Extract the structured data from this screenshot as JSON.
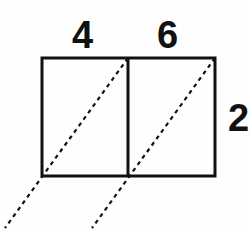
{
  "figure": {
    "kind": "geometry-diagram",
    "background_color": "#fefefe",
    "stroke_color": "#111111",
    "solid_stroke_width": 3,
    "dashed_stroke_width": 2.2,
    "dash_pattern": "4 4",
    "labels": {
      "top_left": "4",
      "top_right": "6",
      "right_height": "2"
    },
    "geometry": {
      "outer_rect": {
        "x": 42,
        "y": 58,
        "width": 173,
        "height": 118
      },
      "divider_x": 128,
      "left_cell": {
        "x": 42,
        "y": 58,
        "width": 86,
        "height": 118
      },
      "right_cell": {
        "x": 128,
        "y": 58,
        "width": 87,
        "height": 118
      },
      "dashed_lines": [
        {
          "name": "dashed-diagonal-left",
          "x1": 128,
          "y1": 58,
          "x2": 5,
          "y2": 228
        },
        {
          "name": "dashed-diagonal-right",
          "x1": 215,
          "y1": 58,
          "x2": 92,
          "y2": 228
        }
      ]
    }
  }
}
